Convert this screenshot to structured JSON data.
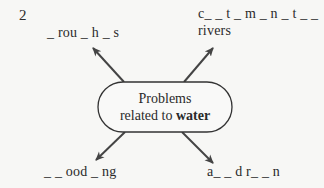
{
  "exercise_number": "2",
  "center": {
    "line1": "Problems",
    "line2_prefix": "related to ",
    "line2_bold": "water"
  },
  "branches": [
    {
      "position": "top-left",
      "text": "_ rou _ h _ s"
    },
    {
      "position": "top-right",
      "line1": "c_ _ t _ m _ n _ t _ _",
      "line2": "rivers"
    },
    {
      "position": "bottom-left",
      "text": "_ _ ood _ ng"
    },
    {
      "position": "bottom-right",
      "text": "a_ _  d r_ _ n"
    }
  ],
  "colors": {
    "background": "#f7f7f5",
    "text": "#2a2a2a",
    "arrow": "#444444",
    "oval_border": "#333333"
  }
}
